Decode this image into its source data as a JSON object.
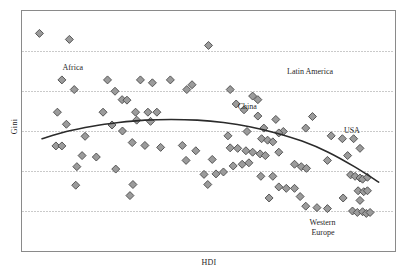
{
  "chart_data": {
    "type": "scatter",
    "title": "",
    "xlabel": "HDI",
    "ylabel": "Gini",
    "grid": true,
    "grid_orientation": "horizontal",
    "gridline_count": 5,
    "legend": "none",
    "xlim": [
      0,
      1
    ],
    "ylim": [
      0,
      1
    ],
    "marker": {
      "shape": "diamond",
      "fill": "#9b9b9b",
      "stroke": "#4a4a4a",
      "size_px": 8
    },
    "series": [
      {
        "name": "countries",
        "points": [
          [
            0.048,
            0.905
          ],
          [
            0.128,
            0.88
          ],
          [
            0.5,
            0.855
          ],
          [
            0.108,
            0.712
          ],
          [
            0.23,
            0.712
          ],
          [
            0.318,
            0.712
          ],
          [
            0.398,
            0.712
          ],
          [
            0.141,
            0.672
          ],
          [
            0.25,
            0.665
          ],
          [
            0.35,
            0.7
          ],
          [
            0.456,
            0.692
          ],
          [
            0.442,
            0.672
          ],
          [
            0.269,
            0.63
          ],
          [
            0.282,
            0.628
          ],
          [
            0.558,
            0.672
          ],
          [
            0.618,
            0.645
          ],
          [
            0.632,
            0.63
          ],
          [
            0.574,
            0.612
          ],
          [
            0.096,
            0.578
          ],
          [
            0.218,
            0.578
          ],
          [
            0.305,
            0.578
          ],
          [
            0.338,
            0.578
          ],
          [
            0.362,
            0.578
          ],
          [
            0.12,
            0.528
          ],
          [
            0.345,
            0.54
          ],
          [
            0.242,
            0.525
          ],
          [
            0.308,
            0.545
          ],
          [
            0.595,
            0.588
          ],
          [
            0.632,
            0.562
          ],
          [
            0.68,
            0.548
          ],
          [
            0.648,
            0.512
          ],
          [
            0.7,
            0.498
          ],
          [
            0.778,
            0.56
          ],
          [
            0.76,
            0.512
          ],
          [
            0.27,
            0.5
          ],
          [
            0.17,
            0.478
          ],
          [
            0.603,
            0.498
          ],
          [
            0.552,
            0.48
          ],
          [
            0.642,
            0.468
          ],
          [
            0.658,
            0.462
          ],
          [
            0.672,
            0.455
          ],
          [
            0.688,
            0.492
          ],
          [
            0.828,
            0.48
          ],
          [
            0.092,
            0.438
          ],
          [
            0.108,
            0.438
          ],
          [
            0.296,
            0.452
          ],
          [
            0.33,
            0.44
          ],
          [
            0.372,
            0.432
          ],
          [
            0.43,
            0.44
          ],
          [
            0.466,
            0.418
          ],
          [
            0.558,
            0.43
          ],
          [
            0.578,
            0.428
          ],
          [
            0.6,
            0.418
          ],
          [
            0.618,
            0.412
          ],
          [
            0.638,
            0.405
          ],
          [
            0.652,
            0.398
          ],
          [
            0.688,
            0.412
          ],
          [
            0.858,
            0.468
          ],
          [
            0.888,
            0.468
          ],
          [
            0.905,
            0.428
          ],
          [
            0.872,
            0.398
          ],
          [
            0.162,
            0.398
          ],
          [
            0.2,
            0.392
          ],
          [
            0.44,
            0.378
          ],
          [
            0.51,
            0.382
          ],
          [
            0.566,
            0.355
          ],
          [
            0.59,
            0.362
          ],
          [
            0.608,
            0.368
          ],
          [
            0.73,
            0.362
          ],
          [
            0.748,
            0.352
          ],
          [
            0.762,
            0.345
          ],
          [
            0.818,
            0.378
          ],
          [
            0.148,
            0.352
          ],
          [
            0.252,
            0.342
          ],
          [
            0.488,
            0.32
          ],
          [
            0.52,
            0.322
          ],
          [
            0.54,
            0.33
          ],
          [
            0.64,
            0.312
          ],
          [
            0.672,
            0.312
          ],
          [
            0.88,
            0.318
          ],
          [
            0.892,
            0.312
          ],
          [
            0.905,
            0.305
          ],
          [
            0.912,
            0.3
          ],
          [
            0.925,
            0.308
          ],
          [
            0.145,
            0.275
          ],
          [
            0.298,
            0.278
          ],
          [
            0.498,
            0.278
          ],
          [
            0.688,
            0.268
          ],
          [
            0.708,
            0.262
          ],
          [
            0.73,
            0.262
          ],
          [
            0.9,
            0.252
          ],
          [
            0.915,
            0.248
          ],
          [
            0.925,
            0.252
          ],
          [
            0.29,
            0.232
          ],
          [
            0.662,
            0.222
          ],
          [
            0.745,
            0.228
          ],
          [
            0.86,
            0.222
          ],
          [
            0.905,
            0.212
          ],
          [
            0.76,
            0.188
          ],
          [
            0.79,
            0.182
          ],
          [
            0.818,
            0.178
          ],
          [
            0.885,
            0.168
          ],
          [
            0.898,
            0.162
          ],
          [
            0.912,
            0.165
          ],
          [
            0.922,
            0.158
          ],
          [
            0.932,
            0.162
          ]
        ]
      }
    ],
    "trend_line": {
      "name": "fitted quadratic curve",
      "color": "#2b2b2b",
      "points": [
        [
          0.055,
          0.468
        ],
        [
          0.12,
          0.498
        ],
        [
          0.19,
          0.52
        ],
        [
          0.26,
          0.535
        ],
        [
          0.33,
          0.545
        ],
        [
          0.4,
          0.548
        ],
        [
          0.47,
          0.545
        ],
        [
          0.54,
          0.535
        ],
        [
          0.61,
          0.518
        ],
        [
          0.68,
          0.492
        ],
        [
          0.75,
          0.458
        ],
        [
          0.82,
          0.412
        ],
        [
          0.89,
          0.352
        ],
        [
          0.955,
          0.288
        ]
      ]
    },
    "annotations": [
      {
        "text": "Africa",
        "x": 0.11,
        "y": 0.76
      },
      {
        "text": "Latin America",
        "x": 0.71,
        "y": 0.745
      },
      {
        "text": "China",
        "x": 0.578,
        "y": 0.6
      },
      {
        "text": "USA",
        "x": 0.862,
        "y": 0.5
      },
      {
        "text": "Western",
        "x": 0.77,
        "y": 0.12
      },
      {
        "text": "Europe",
        "x": 0.775,
        "y": 0.075
      }
    ]
  },
  "axes": {
    "y_title": "Gini",
    "x_title": "HDI"
  },
  "style": {
    "frame_color": "#8a8a8a",
    "grid_color": "#7a7a7a",
    "background": "#ffffff",
    "marker_fill": "#9b9b9b",
    "marker_stroke": "#4a4a4a",
    "curve_color": "#2b2b2b"
  }
}
